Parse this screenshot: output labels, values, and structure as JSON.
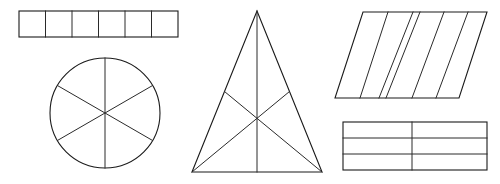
{
  "canvas": {
    "width": 500,
    "height": 184,
    "background": "#ffffff",
    "stroke_color": "#1a1a1a",
    "divider_color": "#2a2a2a"
  },
  "figures": [
    {
      "id": "rectangle-strip",
      "name": "Rectangle strip divided into six equal squares",
      "shape": "rectangle",
      "parts": 6,
      "division": "vertical lines",
      "bounds": {
        "x": 19,
        "y": 11,
        "width": 159,
        "height": 26
      }
    },
    {
      "id": "circle-sectors",
      "name": "Circle divided into six equal sectors",
      "shape": "circle",
      "parts": 6,
      "division": "three diameters",
      "center": {
        "cx": 105,
        "cy": 113
      },
      "radius": 55
    },
    {
      "id": "triangle-medians",
      "name": "Triangle divided into six parts by three medians",
      "shape": "triangle",
      "parts": 6,
      "division": "three medians meeting at centroid",
      "vertices": [
        {
          "x": 257,
          "y": 11
        },
        {
          "x": 192,
          "y": 172
        },
        {
          "x": 322,
          "y": 172
        }
      ],
      "centroid": {
        "x": 257,
        "y": 118
      }
    },
    {
      "id": "parallelogram-strips",
      "name": "Parallelogram divided into six slanted strips",
      "shape": "parallelogram",
      "parts": 6,
      "division": "five slanted lines",
      "corners": [
        {
          "x": 363,
          "y": 12
        },
        {
          "x": 487,
          "y": 12
        },
        {
          "x": 459,
          "y": 98
        },
        {
          "x": 335,
          "y": 98
        }
      ]
    },
    {
      "id": "rectangle-grid",
      "name": "Rectangle divided into six cells in a three by two grid",
      "shape": "rectangle",
      "parts": 6,
      "rows": 3,
      "columns": 2,
      "division": "two horizontal lines and one vertical line",
      "bounds": {
        "x": 343,
        "y": 122,
        "width": 144,
        "height": 48
      }
    }
  ]
}
